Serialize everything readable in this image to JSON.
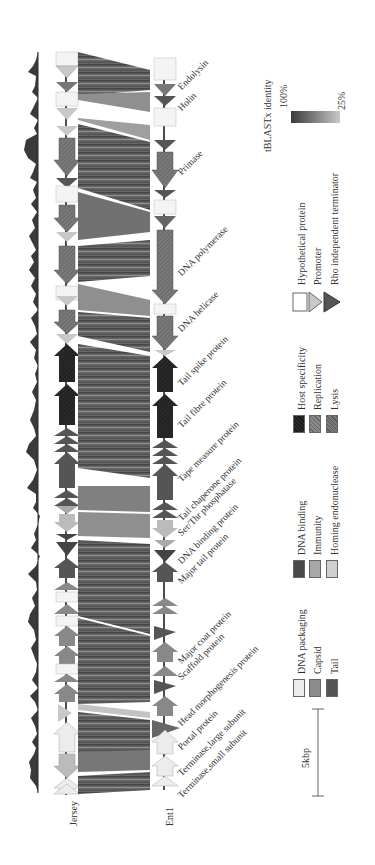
{
  "figure": {
    "genomes": [
      {
        "name": "Jersey"
      },
      {
        "name": "Ent1"
      }
    ],
    "gene_labels": [
      {
        "label": "Endolysin",
        "y": 60
      },
      {
        "label": "Holin",
        "y": 100
      },
      {
        "label": "Primase",
        "y": 165
      },
      {
        "label": "DNA polymerase",
        "y": 275
      },
      {
        "label": "DNA helicase",
        "y": 330
      },
      {
        "label": "Tail spike protein",
        "y": 383
      },
      {
        "label": "Tail fibre protein",
        "y": 420
      },
      {
        "label": "Tape measure protein",
        "y": 473
      },
      {
        "label": "Tail chaperone protein",
        "y": 512
      },
      {
        "label": "Ser/Thr phosphatase",
        "y": 528
      },
      {
        "label": "DNA binding protein",
        "y": 555
      },
      {
        "label": "Major tail protein",
        "y": 575
      },
      {
        "label": "Major coat protein",
        "y": 655
      },
      {
        "label": "Scaffold protein",
        "y": 673
      },
      {
        "label": "Head morphogenesis protein",
        "y": 712
      },
      {
        "label": "Portal protein",
        "y": 740
      },
      {
        "label": "Terminase,large subunit",
        "y": 765
      },
      {
        "label": "Terminase,small subunit",
        "y": 787
      }
    ],
    "legend": {
      "identity_title": "tBLASTx identity",
      "identity_max": "100%",
      "identity_min": "25%",
      "symbols": [
        {
          "label": "Hypothetical protein",
          "shape": "white-box"
        },
        {
          "label": "Promoter",
          "shape": "light-triangle"
        },
        {
          "label": "Rho independent terminator",
          "shape": "dark-triangle"
        }
      ],
      "categories": [
        {
          "label": "Host specificity",
          "color": "#2a2a2a",
          "hatched": true
        },
        {
          "label": "Replication",
          "color": "#8a8a8a",
          "hatched": true
        },
        {
          "label": "Lysis",
          "color": "#7a7a7a",
          "hatched": true
        },
        {
          "label": "DNA binding",
          "color": "#4a4a4a",
          "hatched": false
        },
        {
          "label": "Immunity",
          "color": "#a8a8a8",
          "hatched": false
        },
        {
          "label": "Homing endonuclease",
          "color": "#cfcfcf",
          "hatched": false
        },
        {
          "label": "DNA packaging",
          "color": "#ececec",
          "hatched": false
        },
        {
          "label": "Capsid",
          "color": "#8c8c8c",
          "hatched": false
        },
        {
          "label": "Tail",
          "color": "#555555",
          "hatched": false
        }
      ],
      "scale_bar": "5kbp"
    }
  }
}
